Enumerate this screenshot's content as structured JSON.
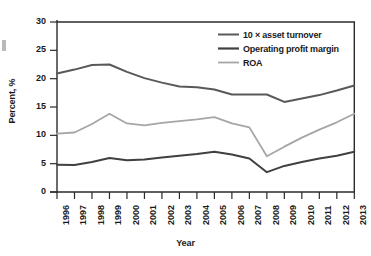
{
  "chart_data": {
    "type": "line",
    "title": "",
    "xlabel": "Year",
    "ylabel": "Percent, %",
    "xlim": [
      1996,
      2013
    ],
    "ylim": [
      0,
      30
    ],
    "yticks": [
      0,
      5,
      10,
      15,
      20,
      25,
      30
    ],
    "grid": false,
    "legend_position": "top-right",
    "x": [
      1996,
      1997,
      1998,
      1999,
      2000,
      2001,
      2002,
      2003,
      2004,
      2005,
      2006,
      2007,
      2008,
      2009,
      2010,
      2011,
      2012,
      2013
    ],
    "categories": [
      "1996",
      "1997",
      "1998",
      "1999",
      "2000",
      "2001",
      "2002",
      "2003",
      "2004",
      "2005",
      "2006",
      "2007",
      "2008",
      "2009",
      "2010",
      "2011",
      "2012",
      "2013"
    ],
    "series": [
      {
        "name": "10 × asset turnover",
        "color": "#595959",
        "width": 2.0,
        "values": [
          20.9,
          21.6,
          22.4,
          22.5,
          21.2,
          20.1,
          19.3,
          18.6,
          18.5,
          18.1,
          17.2,
          17.2,
          17.2,
          15.9,
          16.5,
          17.1,
          17.9,
          18.8
        ]
      },
      {
        "name": "Operating profit margin",
        "color": "#404040",
        "width": 2.0,
        "values": [
          4.8,
          4.75,
          5.3,
          6.0,
          5.6,
          5.75,
          6.1,
          6.4,
          6.7,
          7.1,
          6.6,
          5.9,
          3.5,
          4.6,
          5.3,
          5.9,
          6.4,
          7.1
        ]
      },
      {
        "name": "ROA",
        "color": "#a6a6a6",
        "width": 1.8,
        "values": [
          10.3,
          10.5,
          12.0,
          13.8,
          12.1,
          11.75,
          12.2,
          12.5,
          12.8,
          13.2,
          12.1,
          11.4,
          6.3,
          8.0,
          9.6,
          11.0,
          12.3,
          13.8
        ]
      }
    ]
  },
  "axes": {
    "y_title": "Percent, %",
    "x_title": "Year",
    "y_tick_labels": [
      "30",
      "25",
      "20",
      "15",
      "10",
      "5",
      "0"
    ],
    "x_tick_labels": [
      "1996",
      "1997",
      "1998",
      "1999",
      "2000",
      "2001",
      "2002",
      "2003",
      "2004",
      "2005",
      "2006",
      "2007",
      "2008",
      "2009",
      "2010",
      "2011",
      "2012",
      "2013"
    ]
  },
  "legend": {
    "items": [
      {
        "label": "10 × asset turnover",
        "color": "#595959"
      },
      {
        "label": "Operating profit margin",
        "color": "#404040"
      },
      {
        "label": "ROA",
        "color": "#a6a6a6"
      }
    ]
  },
  "colors": {
    "asset_turnover": "#595959",
    "operating_profit_margin": "#404040",
    "roa": "#a6a6a6",
    "axis": "#2b2b2b",
    "background": "#ffffff"
  }
}
